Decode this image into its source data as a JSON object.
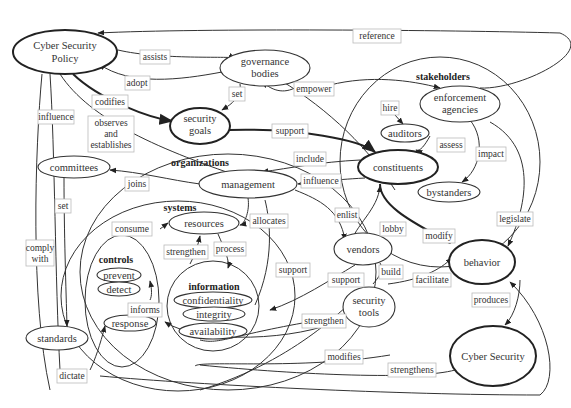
{
  "clusters": [
    {
      "id": "stakeholders",
      "label": "stakeholders",
      "cx": 440,
      "cy": 160,
      "rx": 135,
      "ry": 140,
      "lx": 440,
      "ly": 77
    },
    {
      "id": "organizations",
      "label": "organizations",
      "cx": 215,
      "cy": 270,
      "rx": 160,
      "ry": 120,
      "lx": 198,
      "ly": 164
    },
    {
      "id": "systems",
      "label": "systems",
      "cx": 175,
      "cy": 296,
      "rx": 125,
      "ry": 100,
      "lx": 178,
      "ly": 211
    },
    {
      "id": "controls",
      "label": "controls",
      "cx": 124,
      "cy": 320,
      "rx": 38,
      "ry": 60,
      "lx": 112,
      "ly": 262
    },
    {
      "id": "information",
      "label": "information",
      "cx": 213,
      "cy": 310,
      "rx": 45,
      "ry": 44,
      "lx": 212,
      "ly": 288
    }
  ],
  "nodes": [
    {
      "id": "policy",
      "label": [
        "Cyber Security",
        "Policy"
      ],
      "cx": 65,
      "cy": 52,
      "rx": 52,
      "ry": 22,
      "bold": true
    },
    {
      "id": "governance",
      "label": [
        "governance",
        "bodies"
      ],
      "cx": 265,
      "cy": 68,
      "rx": 45,
      "ry": 18
    },
    {
      "id": "goals",
      "label": [
        "security",
        "goals"
      ],
      "cx": 200,
      "cy": 126,
      "rx": 30,
      "ry": 18,
      "bold": true
    },
    {
      "id": "enforcement",
      "label": [
        "enforcement",
        "agencies"
      ],
      "cx": 455,
      "cy": 104,
      "rx": 40,
      "ry": 18
    },
    {
      "id": "auditors",
      "label": [
        "auditors"
      ],
      "cx": 407,
      "cy": 133,
      "rx": 24,
      "ry": 9
    },
    {
      "id": "constituents",
      "label": [
        "constituents"
      ],
      "cx": 402,
      "cy": 167,
      "rx": 40,
      "ry": 19,
      "bold": true
    },
    {
      "id": "bystanders",
      "label": [
        "bystanders"
      ],
      "cx": 450,
      "cy": 192,
      "rx": 31,
      "ry": 10
    },
    {
      "id": "committees",
      "label": [
        "committees"
      ],
      "cx": 74,
      "cy": 167,
      "rx": 36,
      "ry": 11
    },
    {
      "id": "management",
      "label": [
        "management"
      ],
      "cx": 248,
      "cy": 184,
      "rx": 49,
      "ry": 14
    },
    {
      "id": "resources",
      "label": [
        "resources"
      ],
      "cx": 203,
      "cy": 223,
      "rx": 36,
      "ry": 11
    },
    {
      "id": "vendors",
      "label": [
        "vendors"
      ],
      "cx": 363,
      "cy": 249,
      "rx": 29,
      "ry": 16
    },
    {
      "id": "behavior",
      "label": [
        "behavior"
      ],
      "cx": 481,
      "cy": 263,
      "rx": 33,
      "ry": 22,
      "bold": true
    },
    {
      "id": "prevent",
      "label": [
        "prevent"
      ],
      "cx": 119,
      "cy": 275,
      "rx": 22,
      "ry": 7
    },
    {
      "id": "detect",
      "label": [
        "detect"
      ],
      "cx": 119,
      "cy": 289,
      "rx": 21,
      "ry": 7
    },
    {
      "id": "response",
      "label": [
        "response"
      ],
      "cx": 129,
      "cy": 324,
      "rx": 26,
      "ry": 8
    },
    {
      "id": "confidentiality",
      "label": [
        "confidentiality"
      ],
      "cx": 213,
      "cy": 300,
      "rx": 39,
      "ry": 8
    },
    {
      "id": "integrity",
      "label": [
        "integrity"
      ],
      "cx": 214,
      "cy": 314,
      "rx": 31,
      "ry": 7
    },
    {
      "id": "availability",
      "label": [
        "availability"
      ],
      "cx": 213,
      "cy": 331,
      "rx": 34,
      "ry": 8
    },
    {
      "id": "standards",
      "label": [
        "standards"
      ],
      "cx": 57,
      "cy": 338,
      "rx": 31,
      "ry": 12
    },
    {
      "id": "tools",
      "label": [
        "security",
        "tools"
      ],
      "cx": 370,
      "cy": 379,
      "rx": 26,
      "ry": 21,
      "transform_y": -95
    },
    {
      "id": "cybersecurity",
      "label": [
        "Cyber Security"
      ],
      "cx": 493,
      "cy": 356,
      "rx": 43,
      "ry": 30,
      "bold": true
    }
  ],
  "edge_labels": [
    {
      "text": [
        "reference"
      ],
      "x": 371,
      "y": 36
    },
    {
      "text": [
        "assists"
      ],
      "x": 154,
      "y": 57
    },
    {
      "text": [
        "adopt"
      ],
      "x": 138,
      "y": 82
    },
    {
      "text": [
        "codifies"
      ],
      "x": 109,
      "y": 102
    },
    {
      "text": [
        "set"
      ],
      "x": 237,
      "y": 94
    },
    {
      "text": [
        "empower"
      ],
      "x": 314,
      "y": 90
    },
    {
      "text": [
        "hire"
      ],
      "x": 390,
      "y": 108
    },
    {
      "text": [
        "assess"
      ],
      "x": 439,
      "y": 145
    },
    {
      "text": [
        "impact"
      ],
      "x": 486,
      "y": 155
    },
    {
      "text": [
        "support"
      ],
      "x": 289,
      "y": 132
    },
    {
      "text": [
        "influence"
      ],
      "x": 56,
      "y": 117
    },
    {
      "text": [
        "observes",
        "and",
        "establishes"
      ],
      "x": 111,
      "y": 141
    },
    {
      "text": [
        "include"
      ],
      "x": 311,
      "y": 159
    },
    {
      "text": [
        "influence"
      ],
      "x": 321,
      "y": 181
    },
    {
      "text": [
        "joins"
      ],
      "x": 136,
      "y": 184
    },
    {
      "text": [
        "set"
      ],
      "x": 62,
      "y": 206
    },
    {
      "text": [
        "consume"
      ],
      "x": 137,
      "y": 229
    },
    {
      "text": [
        "allocates"
      ],
      "x": 269,
      "y": 221
    },
    {
      "text": [
        "enlist"
      ],
      "x": 346,
      "y": 215
    },
    {
      "text": [
        "lobby"
      ],
      "x": 394,
      "y": 229
    },
    {
      "text": [
        "modify"
      ],
      "x": 436,
      "y": 236
    },
    {
      "text": [
        "legislate"
      ],
      "x": 516,
      "y": 219
    },
    {
      "text": [
        "strengthen"
      ],
      "x": 202,
      "y": 252
    },
    {
      "text": [
        "process"
      ],
      "x": 229,
      "y": 250
    },
    {
      "text": [
        "comply",
        "with"
      ],
      "x": 39,
      "y": 255
    },
    {
      "text": [
        "support"
      ],
      "x": 291,
      "y": 269
    },
    {
      "text": [
        "build"
      ],
      "x": 388,
      "y": 272
    },
    {
      "text": [
        "facilitate"
      ],
      "x": 442,
      "y": 282
    },
    {
      "text": [
        "informs"
      ],
      "x": 147,
      "y": 309
    },
    {
      "text": [
        "support"
      ],
      "x": 333,
      "y": 281
    },
    {
      "text": [
        "produces"
      ],
      "x": 507,
      "y": 303
    },
    {
      "text": [
        "strengthen"
      ],
      "x": 326,
      "y": 319
    },
    {
      "text": [
        "modifies"
      ],
      "x": 341,
      "y": 359
    },
    {
      "text": [
        "dictate"
      ],
      "x": 70,
      "y": 377
    },
    {
      "text": [
        "strengthens"
      ],
      "x": 411,
      "y": 372
    }
  ]
}
